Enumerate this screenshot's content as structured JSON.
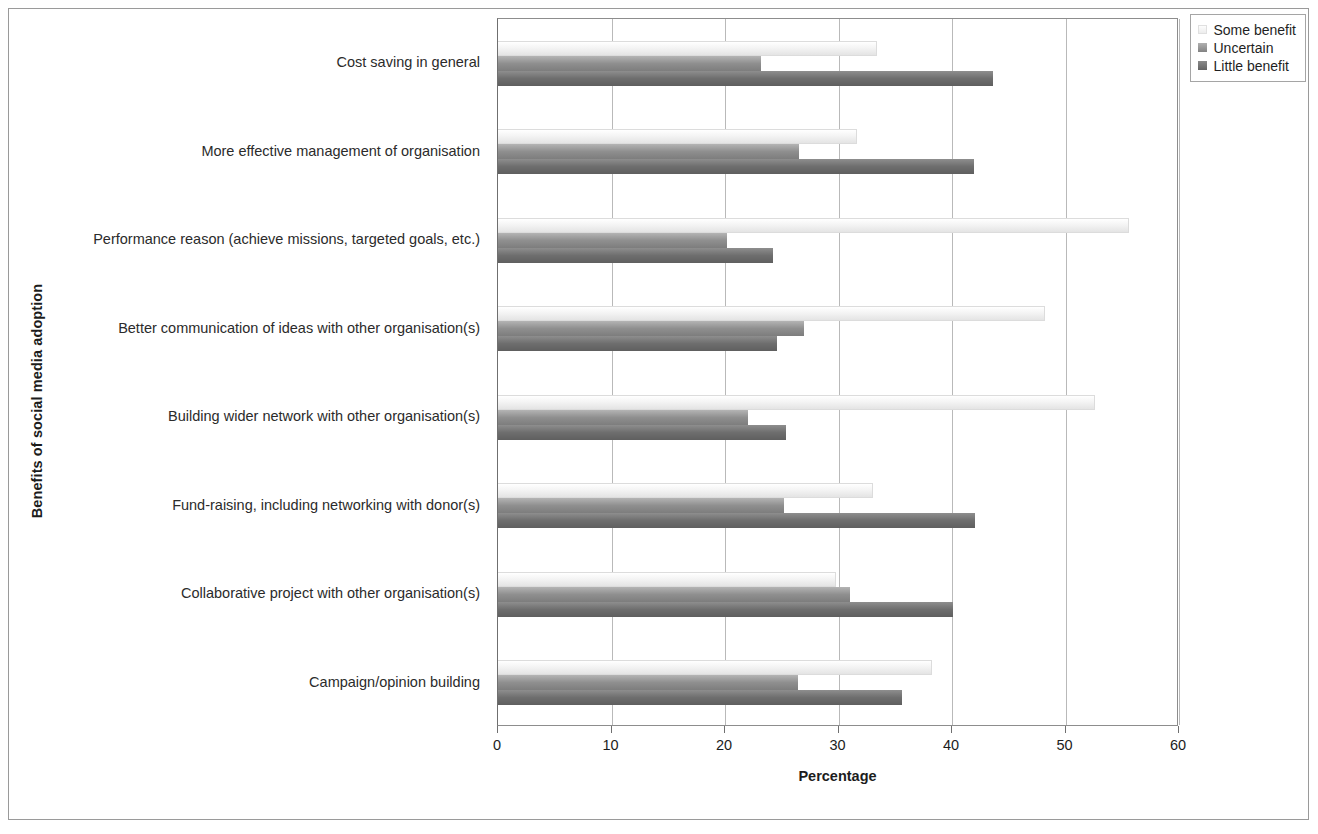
{
  "figure": {
    "x_axis_title": "Percentage",
    "y_axis_title": "Benefits of social media adoption"
  },
  "legend": {
    "position": "top-right",
    "items": [
      {
        "label": "Some benefit",
        "swatch": "some",
        "color": "#f0f0f0"
      },
      {
        "label": "Uncertain",
        "swatch": "uncertain",
        "color": "#8f8f8f"
      },
      {
        "label": "Little benefit",
        "swatch": "little",
        "color": "#6e6e6e"
      }
    ]
  },
  "chart_data": {
    "type": "bar",
    "orientation": "horizontal",
    "title": "",
    "xlabel": "Percentage",
    "ylabel": "Benefits of social media adoption",
    "xlim": [
      0,
      60
    ],
    "xticks": [
      0,
      10,
      20,
      30,
      40,
      50,
      60
    ],
    "grid": true,
    "legend_position": "top-right",
    "categories": [
      "Cost saving in general",
      "More effective management of organisation",
      "Performance reason (achieve missions, targeted goals, etc.)",
      "Better communication of ideas with other organisation(s)",
      "Building wider network with other organisation(s)",
      "Fund-raising, including networking with donor(s)",
      "Collaborative project with other organisation(s)",
      "Campaign/opinion building"
    ],
    "series": [
      {
        "name": "Some benefit",
        "color": "#f0f0f0",
        "values": [
          33.4,
          31.6,
          55.6,
          48.2,
          52.6,
          33.0,
          29.8,
          38.2
        ]
      },
      {
        "name": "Uncertain",
        "color": "#8f8f8f",
        "values": [
          23.2,
          26.5,
          20.2,
          27.0,
          22.0,
          25.2,
          31.0,
          26.4
        ]
      },
      {
        "name": "Little benefit",
        "color": "#6e6e6e",
        "values": [
          43.6,
          41.9,
          24.2,
          24.6,
          25.4,
          42.0,
          40.1,
          35.6
        ]
      }
    ]
  }
}
